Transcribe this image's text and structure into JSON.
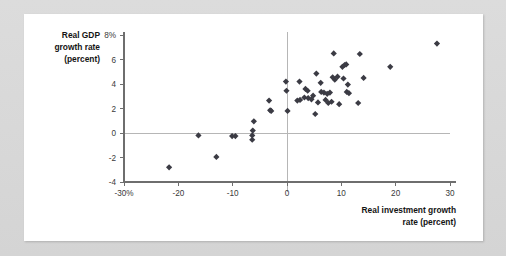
{
  "figure": {
    "background_color": "#d9d9d9",
    "card_color": "#ffffff",
    "marker_color": "#3b3b44",
    "axis_color": "#6e6e6e"
  },
  "chart_data": {
    "type": "scatter",
    "title": "",
    "subtitle": "",
    "xlabel": "Real investment growth rate (percent)",
    "ylabel": "Real GDP growth rate (percent)",
    "ylabel_lines": [
      "Real GDP",
      "growth rate",
      "(percent)"
    ],
    "xlabel_lines": [
      "Real investment growth",
      "rate (percent)"
    ],
    "xlim": [
      -30,
      30
    ],
    "ylim": [
      -4,
      8
    ],
    "xticks": [
      -30,
      -20,
      -10,
      0,
      10,
      20,
      30
    ],
    "xtick_labels": [
      "-30%",
      "-20",
      "-10",
      "0",
      "10",
      "20",
      "30"
    ],
    "yticks": [
      -4,
      -2,
      0,
      2,
      4,
      6,
      8
    ],
    "ytick_labels": [
      "-4",
      "-2",
      "0",
      "2",
      "4",
      "6",
      "8%"
    ],
    "grid": false,
    "legend": null,
    "zero_lines": {
      "x": 0,
      "y": 0
    },
    "marker_shape": "diamond",
    "points": [
      {
        "x": -21.7,
        "y": -2.8
      },
      {
        "x": -16.3,
        "y": -0.2
      },
      {
        "x": -13.0,
        "y": -1.95
      },
      {
        "x": -10.1,
        "y": -0.25
      },
      {
        "x": -9.5,
        "y": -0.25
      },
      {
        "x": -6.4,
        "y": -0.2
      },
      {
        "x": -6.3,
        "y": 0.2
      },
      {
        "x": -6.4,
        "y": -0.55
      },
      {
        "x": -6.1,
        "y": 0.95
      },
      {
        "x": -3.3,
        "y": 2.65
      },
      {
        "x": -3.1,
        "y": 1.85
      },
      {
        "x": -2.9,
        "y": 1.8
      },
      {
        "x": -0.2,
        "y": 4.2
      },
      {
        "x": -0.1,
        "y": 3.45
      },
      {
        "x": 0.1,
        "y": 1.8
      },
      {
        "x": 2.3,
        "y": 4.2
      },
      {
        "x": 1.9,
        "y": 2.65
      },
      {
        "x": 2.4,
        "y": 2.7
      },
      {
        "x": 3.4,
        "y": 3.6
      },
      {
        "x": 3.8,
        "y": 3.45
      },
      {
        "x": 3.2,
        "y": 2.9
      },
      {
        "x": 3.9,
        "y": 2.85
      },
      {
        "x": 4.5,
        "y": 2.75
      },
      {
        "x": 4.8,
        "y": 3.05
      },
      {
        "x": 5.2,
        "y": 1.55
      },
      {
        "x": 5.4,
        "y": 4.85
      },
      {
        "x": 5.7,
        "y": 2.5
      },
      {
        "x": 6.2,
        "y": 4.1
      },
      {
        "x": 6.3,
        "y": 3.35
      },
      {
        "x": 6.8,
        "y": 3.3
      },
      {
        "x": 7.1,
        "y": 2.7
      },
      {
        "x": 7.4,
        "y": 3.2
      },
      {
        "x": 7.6,
        "y": 2.45
      },
      {
        "x": 7.9,
        "y": 3.3
      },
      {
        "x": 8.2,
        "y": 2.55
      },
      {
        "x": 8.4,
        "y": 4.55
      },
      {
        "x": 8.8,
        "y": 4.35
      },
      {
        "x": 8.6,
        "y": 6.5
      },
      {
        "x": 9.3,
        "y": 4.6
      },
      {
        "x": 9.6,
        "y": 2.35
      },
      {
        "x": 10.2,
        "y": 5.4
      },
      {
        "x": 10.6,
        "y": 5.55
      },
      {
        "x": 10.9,
        "y": 5.6
      },
      {
        "x": 10.4,
        "y": 4.45
      },
      {
        "x": 11.2,
        "y": 3.95
      },
      {
        "x": 11.0,
        "y": 3.35
      },
      {
        "x": 11.4,
        "y": 3.25
      },
      {
        "x": 13.1,
        "y": 2.45
      },
      {
        "x": 13.4,
        "y": 6.45
      },
      {
        "x": 14.1,
        "y": 4.5
      },
      {
        "x": 19.0,
        "y": 5.4
      },
      {
        "x": 27.6,
        "y": 7.3
      }
    ]
  }
}
